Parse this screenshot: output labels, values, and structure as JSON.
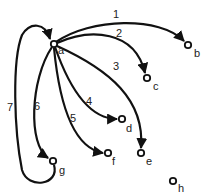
{
  "diagram": {
    "type": "directed-graph",
    "nodes": [
      {
        "id": "a",
        "label": "a",
        "x": 54,
        "y": 44,
        "lx": 58,
        "ly": 54
      },
      {
        "id": "b",
        "label": "b",
        "x": 188,
        "y": 45,
        "lx": 194,
        "ly": 57
      },
      {
        "id": "c",
        "label": "c",
        "x": 147,
        "y": 78,
        "lx": 153,
        "ly": 90
      },
      {
        "id": "d",
        "label": "d",
        "x": 122,
        "y": 119,
        "lx": 126,
        "ly": 132
      },
      {
        "id": "e",
        "label": "e",
        "x": 141,
        "y": 153,
        "lx": 146,
        "ly": 165
      },
      {
        "id": "f",
        "label": "f",
        "x": 108,
        "y": 153,
        "lx": 112,
        "ly": 165
      },
      {
        "id": "g",
        "label": "g",
        "x": 53,
        "y": 161,
        "lx": 59,
        "ly": 174
      },
      {
        "id": "h",
        "label": "h",
        "x": 173,
        "y": 181,
        "lx": 178,
        "ly": 192
      }
    ],
    "edges": [
      {
        "id": "1",
        "label": "1",
        "from": "a",
        "to": "b",
        "path": "M56,42 C90,18 160,16 184,41",
        "lx": 113,
        "ly": 18
      },
      {
        "id": "2",
        "label": "2",
        "from": "a",
        "to": "c",
        "path": "M57,43 C90,28 135,30 145,73",
        "lx": 116,
        "ly": 37
      },
      {
        "id": "3",
        "label": "3",
        "from": "a",
        "to": "e",
        "path": "M57,46 C110,70 145,100 141,148",
        "lx": 113,
        "ly": 70
      },
      {
        "id": "4",
        "label": "4",
        "from": "a",
        "to": "d",
        "path": "M55,47 C70,90 90,119 117,119",
        "lx": 86,
        "ly": 105
      },
      {
        "id": "5",
        "label": "5",
        "from": "a",
        "to": "f",
        "path": "M54,48 C60,110 75,148 103,153",
        "lx": 70,
        "ly": 122
      },
      {
        "id": "6",
        "label": "6",
        "from": "a",
        "to": "g",
        "path": "M52,47 C30,80 28,145 48,158",
        "lx": 34,
        "ly": 110
      },
      {
        "id": "7",
        "label": "7",
        "from": "g",
        "to": "a",
        "path": "M54,165 C60,185 28,190 22,170 C14,130 12,60 22,35 C30,22 45,22 50,39",
        "lx": 7,
        "ly": 111
      }
    ]
  }
}
